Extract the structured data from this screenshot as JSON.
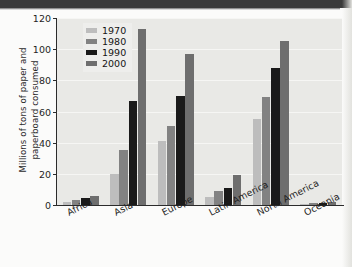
{
  "chart_data": {
    "type": "bar",
    "title": "",
    "xlabel": "",
    "ylabel_lines": [
      "Millions of tons of paper and",
      "paperboard consumed"
    ],
    "ylabel": "Millions of tons of paper and paperboard consumed",
    "categories": [
      "Africa",
      "Asia",
      "Europe",
      "Latin America",
      "North America",
      "Oceania"
    ],
    "series": [
      {
        "name": "1970",
        "color": "#bdbdbd",
        "values": [
          2,
          20,
          41,
          5,
          55,
          0.5
        ]
      },
      {
        "name": "1980",
        "color": "#828282",
        "values": [
          3,
          35,
          51,
          9,
          69,
          1
        ]
      },
      {
        "name": "1990",
        "color": "#1a1a1a",
        "values": [
          4.5,
          67,
          70,
          11,
          88,
          1.5
        ]
      },
      {
        "name": "2000",
        "color": "#6e6e6e",
        "values": [
          5.5,
          113,
          97,
          19,
          105,
          2
        ]
      }
    ],
    "ylim": [
      0,
      120
    ],
    "yticks": [
      0,
      20,
      40,
      60,
      80,
      100,
      120
    ],
    "ytick_labels": [
      "0",
      "20",
      "40",
      "60",
      "80",
      "100",
      "120"
    ],
    "grid": true,
    "grid_axis": "y",
    "legend_position": "top-left",
    "plot_background": "#e9e9e6"
  }
}
